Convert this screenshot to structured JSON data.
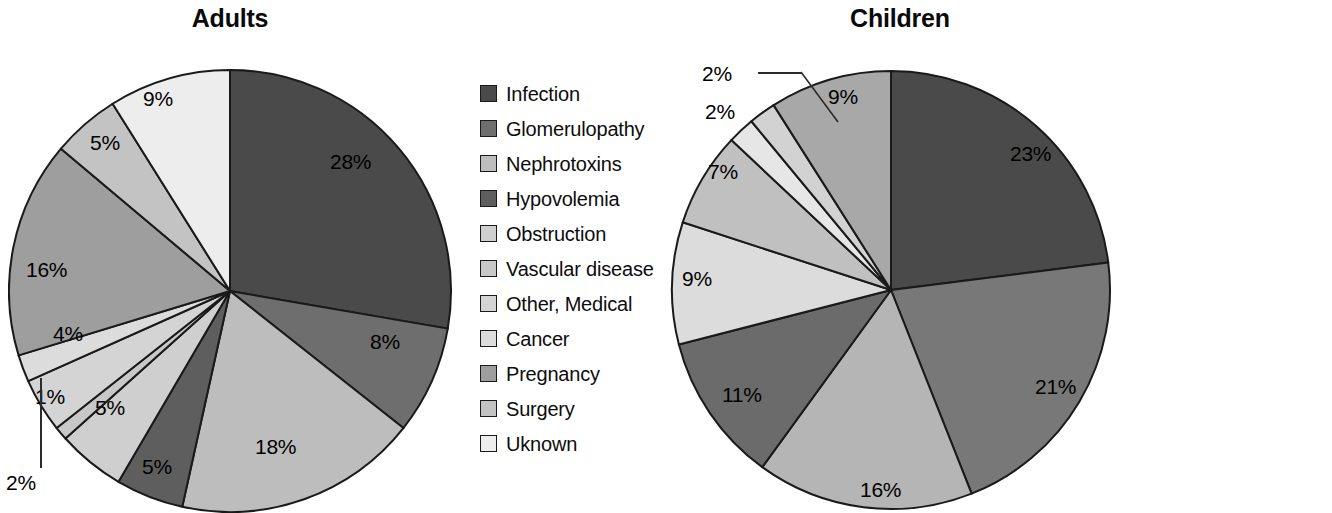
{
  "figure": {
    "background": "#ffffff",
    "text_color": "#000000"
  },
  "chart_data": [
    {
      "type": "pie",
      "title": "Adults",
      "xlabel": "",
      "ylabel": "",
      "legend_position": "right",
      "grid": false,
      "start_angle_deg": 0,
      "direction": "clockwise",
      "categories": [
        "Infection",
        "Glomerulopathy",
        "Nephrotoxins",
        "Hypovolemia",
        "Obstruction",
        "Vascular disease",
        "Other, Medical",
        "Cancer",
        "Pregnancy",
        "Surgery",
        "Uknown"
      ],
      "values": [
        28,
        8,
        18,
        5,
        5,
        1,
        4,
        2,
        16,
        5,
        9
      ],
      "labels": [
        "28%",
        "8%",
        "18%",
        "5%",
        "5%",
        "1%",
        "4%",
        "2%",
        "16%",
        "5%",
        "9%"
      ],
      "colors": [
        "#4a4a4a",
        "#6e6e6e",
        "#bdbdbd",
        "#5e5e5e",
        "#cfcfcf",
        "#c8c8c8",
        "#d4d4d4",
        "#dcdcdc",
        "#9e9e9e",
        "#c3c3c3",
        "#ededed"
      ],
      "slice_border": "#1a1a1a",
      "leader_line_slices": [
        "Cancer"
      ],
      "total": 101
    },
    {
      "type": "pie",
      "title": "Children",
      "xlabel": "",
      "ylabel": "",
      "legend_position": "right",
      "grid": false,
      "start_angle_deg": 0,
      "direction": "clockwise",
      "categories": [
        "Infection",
        "Glomerulopathy",
        "Nephrotoxins",
        "Hypovolemia",
        "Obstruction",
        "Vascular disease",
        "Cancer",
        "Natal asphyxia",
        "Uknown"
      ],
      "values": [
        23,
        21,
        16,
        11,
        9,
        7,
        2,
        2,
        9
      ],
      "labels": [
        "23%",
        "21%",
        "16%",
        "11%",
        "9%",
        "7%",
        "2%",
        "2%",
        "9%"
      ],
      "colors": [
        "#4a4a4a",
        "#787878",
        "#b5b5b5",
        "#6b6b6b",
        "#dcdcdc",
        "#c0c0c0",
        "#e6e6e6",
        "#d2d2d2",
        "#a8a8a8"
      ],
      "slice_border": "#1a1a1a",
      "leader_line_slices": [
        "Cancer",
        "Natal asphyxia"
      ],
      "total": 100
    }
  ],
  "adults": {
    "title": "Adults",
    "slice_labels": [
      {
        "text": "28%",
        "x": 330,
        "y": 150
      },
      {
        "text": "8%",
        "x": 370,
        "y": 330
      },
      {
        "text": "18%",
        "x": 255,
        "y": 435
      },
      {
        "text": "5%",
        "x": 142,
        "y": 455
      },
      {
        "text": "5%",
        "x": 95,
        "y": 396
      },
      {
        "text": "1%",
        "x": 35,
        "y": 385
      },
      {
        "text": "4%",
        "x": 53,
        "y": 322
      },
      {
        "text": "2%",
        "x": 6,
        "y": 471
      },
      {
        "text": "16%",
        "x": 26,
        "y": 258
      },
      {
        "text": "5%",
        "x": 90,
        "y": 131
      },
      {
        "text": "9%",
        "x": 143,
        "y": 87
      }
    ],
    "legend": {
      "items": [
        {
          "label": "Infection",
          "color": "#4a4a4a"
        },
        {
          "label": "Glomerulopathy",
          "color": "#6e6e6e"
        },
        {
          "label": "Nephrotoxins",
          "color": "#bdbdbd"
        },
        {
          "label": "Hypovolemia",
          "color": "#5e5e5e"
        },
        {
          "label": "Obstruction",
          "color": "#cfcfcf"
        },
        {
          "label": "Vascular disease",
          "color": "#c8c8c8"
        },
        {
          "label": "Other, Medical",
          "color": "#d4d4d4"
        },
        {
          "label": "Cancer",
          "color": "#dcdcdc"
        },
        {
          "label": "Pregnancy",
          "color": "#9e9e9e"
        },
        {
          "label": "Surgery",
          "color": "#c3c3c3"
        },
        {
          "label": "Uknown",
          "color": "#ededed"
        }
      ]
    }
  },
  "children": {
    "title": "Children",
    "slice_labels": [
      {
        "text": "23%",
        "x": 350,
        "y": 142
      },
      {
        "text": "21%",
        "x": 375,
        "y": 375
      },
      {
        "text": "16%",
        "x": 200,
        "y": 478
      },
      {
        "text": "11%",
        "x": 62,
        "y": 383
      },
      {
        "text": "9%",
        "x": 22,
        "y": 267
      },
      {
        "text": "7%",
        "x": 48,
        "y": 160
      },
      {
        "text": "2%",
        "x": 45,
        "y": 100
      },
      {
        "text": "2%",
        "x": 42,
        "y": 62
      },
      {
        "text": "9%",
        "x": 168,
        "y": 85
      }
    ],
    "legend": {
      "items": [
        {
          "label": "Infection",
          "color": "#4a4a4a"
        },
        {
          "label": "Glomerulopathy",
          "color": "#787878"
        },
        {
          "label": "Nephrotoxins",
          "color": "#b5b5b5"
        },
        {
          "label": "Hypovolemia",
          "color": "#6b6b6b"
        },
        {
          "label": "Obstruction",
          "color": "#dcdcdc"
        },
        {
          "label": "Vascular disease",
          "color": "#c0c0c0"
        },
        {
          "label": "Cancer",
          "color": "#e6e6e6"
        },
        {
          "label": "Natal asphyxia",
          "color": "#d2d2d2"
        },
        {
          "label": "Uknown",
          "color": "#a8a8a8"
        }
      ]
    }
  }
}
